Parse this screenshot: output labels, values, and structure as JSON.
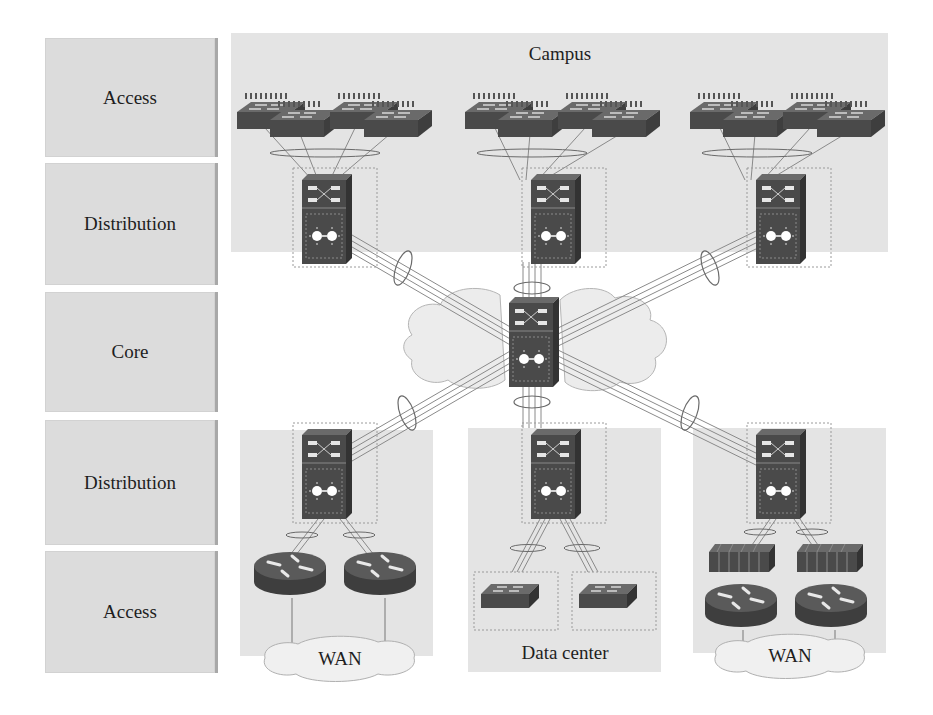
{
  "layers": [
    {
      "label": "Access"
    },
    {
      "label": "Distribution"
    },
    {
      "label": "Core"
    },
    {
      "label": "Distribution"
    },
    {
      "label": "Access"
    }
  ],
  "zones": {
    "campus": {
      "label": "Campus"
    },
    "wan_left": {
      "label": "WAN"
    },
    "data_center": {
      "label": "Data center"
    },
    "wan_right": {
      "label": "WAN"
    }
  },
  "devices": {
    "campus_access_switch_groups": 3,
    "switches_per_campus_group": 4,
    "campus_distribution_switches": 3,
    "core_switches": 1,
    "bottom_distribution_switches": 3,
    "wan_left_routers": 2,
    "data_center_access_switches": 2,
    "wan_right_firewalls": 2,
    "wan_right_routers": 2
  },
  "colors": {
    "panel_gray": "#dcdcdc",
    "zone_gray": "#e4e4e4",
    "device_dark": "#4a4a4a",
    "link_gray": "#7a7a7a",
    "cloud_fill": "#ececec"
  }
}
